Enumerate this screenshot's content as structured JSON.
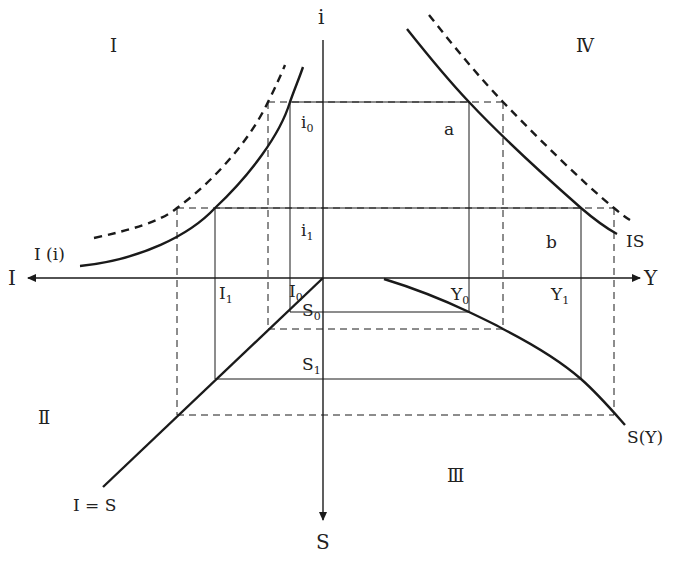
{
  "diagram": {
    "type": "four-quadrant IS derivation",
    "axes": {
      "up": "i",
      "left": "I",
      "right": "Y",
      "down": "S"
    },
    "quadrants": {
      "q1": "Ⅰ",
      "q2": "Ⅱ",
      "q3": "Ⅲ",
      "q4": "Ⅳ"
    },
    "curves": {
      "investment": "I (i)",
      "equilibrium": "I = S",
      "saving": "S(Y)",
      "is_curve": "IS"
    },
    "points": {
      "a": "a",
      "b": "b"
    },
    "levels": {
      "i0": {
        "base": "i",
        "sub": "0"
      },
      "i1": {
        "base": "i",
        "sub": "1"
      },
      "I0": {
        "base": "I",
        "sub": "0"
      },
      "I1": {
        "base": "I",
        "sub": "1"
      },
      "S0": {
        "base": "S",
        "sub": "0"
      },
      "S1": {
        "base": "S",
        "sub": "1"
      },
      "Y0": {
        "base": "Y",
        "sub": "0"
      },
      "Y1": {
        "base": "Y",
        "sub": "1"
      }
    },
    "colors": {
      "line": "#1a1a1a",
      "background": "#ffffff"
    }
  }
}
